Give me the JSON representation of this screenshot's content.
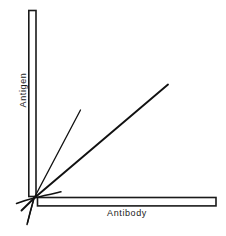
{
  "figure": {
    "background_color": "#ffffff",
    "line_color": "#111111",
    "axis_stroke_color": "#1a1a1a",
    "axis_fill_color": "#ffffff",
    "y_axis_label": "Antigen",
    "x_axis_label": "Antibody"
  },
  "chart_data": {
    "type": "line",
    "title": "",
    "subtitle": "",
    "xlabel": "Antibody",
    "ylabel": "Antigen",
    "xlim": [
      0,
      1
    ],
    "ylim": [
      0,
      1
    ],
    "grid": false,
    "legend": "none",
    "axis_style": "hollow-outlined-bars",
    "annotations": [],
    "tick_labels": {
      "x": [],
      "y": []
    },
    "origin": {
      "x": 34,
      "y": 198
    },
    "series": [
      {
        "name": "steep-line",
        "slope_description": "steep",
        "points": [
          {
            "x": 27,
            "y": 222
          },
          {
            "x": 34,
            "y": 198
          },
          {
            "x": 80,
            "y": 110
          }
        ]
      },
      {
        "name": "main-diagonal",
        "slope_description": "medium",
        "points": [
          {
            "x": 22,
            "y": 210
          },
          {
            "x": 34,
            "y": 198
          },
          {
            "x": 168,
            "y": 85
          }
        ]
      },
      {
        "name": "shallow-curve",
        "slope_description": "shallow-curved",
        "points": [
          {
            "x": 17,
            "y": 203
          },
          {
            "x": 26,
            "y": 200
          },
          {
            "x": 34,
            "y": 198
          },
          {
            "x": 60,
            "y": 192
          }
        ]
      },
      {
        "name": "lower-tail",
        "slope_description": "descending-below-origin",
        "points": [
          {
            "x": 34,
            "y": 198
          },
          {
            "x": 30,
            "y": 212
          },
          {
            "x": 27,
            "y": 224
          }
        ]
      }
    ],
    "axes_geometry": {
      "y_axis_bar": {
        "x": 28,
        "y": 10,
        "width": 8,
        "height": 187
      },
      "x_axis_bar": {
        "x": 37,
        "y": 197,
        "width": 180,
        "height": 9
      }
    }
  }
}
